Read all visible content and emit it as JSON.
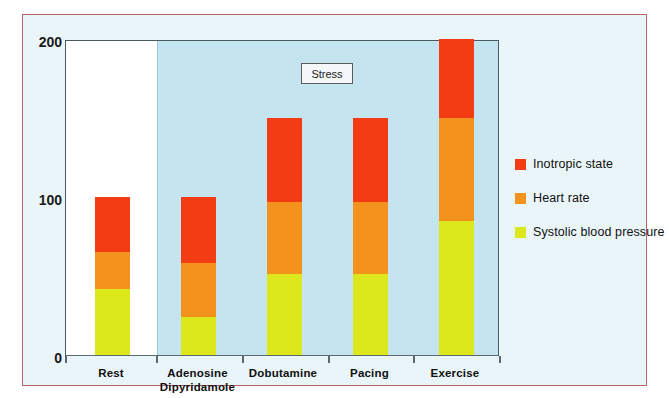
{
  "chart_data": {
    "type": "bar",
    "title": "",
    "subtitle": "",
    "xlabel": "",
    "ylabel": "",
    "stacked": true,
    "grid": false,
    "legend_position": "right",
    "ylim": [
      0,
      200
    ],
    "yticks": [
      "0",
      "100",
      "200"
    ],
    "categories": [
      "Rest",
      "Adenosine Dipyridamole",
      "Dobutamine",
      "Pacing",
      "Exercise"
    ],
    "category_lines": [
      [
        "Rest",
        ""
      ],
      [
        "Adenosine",
        "Dipyridamole"
      ],
      [
        "Dobutamine",
        ""
      ],
      [
        "Pacing",
        ""
      ],
      [
        "Exercise",
        ""
      ]
    ],
    "series": [
      {
        "name": "Systolic blood pressure",
        "color": "#dce81c",
        "values": [
          42,
          24,
          51,
          51,
          85
        ]
      },
      {
        "name": "Heart rate",
        "color": "#f4921e",
        "values": [
          23,
          34,
          46,
          46,
          65
        ]
      },
      {
        "name": "Inotropic state",
        "color": "#f43c14",
        "values": [
          35,
          42,
          53,
          53,
          50
        ]
      }
    ],
    "cumulative_tops": [
      [
        42,
        65,
        100
      ],
      [
        24,
        58,
        100
      ],
      [
        51,
        97,
        150
      ],
      [
        51,
        97,
        150
      ],
      [
        85,
        150,
        200
      ]
    ],
    "annotations": [
      {
        "text": "Stress",
        "kind": "boxed-label"
      }
    ],
    "regions": [
      {
        "label": "baseline",
        "background": "#ffffff",
        "categories": [
          "Rest"
        ]
      },
      {
        "label": "Stress",
        "background": "#c4e4f0",
        "categories": [
          "Adenosine Dipyridamole",
          "Dobutamine",
          "Pacing",
          "Exercise"
        ]
      }
    ],
    "colors": {
      "inotropic_state": "#f43c14",
      "heart_rate": "#f4921e",
      "systolic_blood_pressure": "#dce81c",
      "stress_band": "#c4e4f0",
      "figure_background": "#eaf5f9",
      "figure_border": "#b5656a",
      "plot_border": "#4a5a60"
    }
  },
  "legend": {
    "items": [
      {
        "label": "Inotropic state",
        "color": "#f43c14"
      },
      {
        "label": "Heart rate",
        "color": "#f4921e"
      },
      {
        "label": "Systolic blood pressure",
        "color": "#dce81c"
      }
    ]
  },
  "axis": {
    "y": {
      "t200": "200",
      "t100": "100",
      "t0": "0"
    }
  },
  "annotation": {
    "stress": "Stress"
  }
}
